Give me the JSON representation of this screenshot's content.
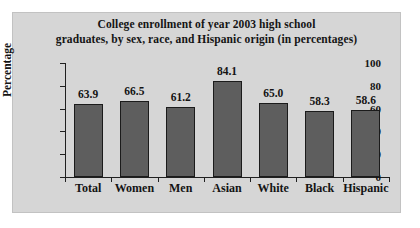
{
  "chart_data": {
    "type": "bar",
    "title": "College enrollment of year 2003 high school graduates, by sex, race, and Hispanic origin (in percentages)",
    "title_lines": [
      "College enrollment of year 2003 high school",
      "graduates, by sex, race, and Hispanic origin (in percentages)"
    ],
    "categories": [
      "Total",
      "Women",
      "Men",
      "Asian",
      "White",
      "Black",
      "Hispanic"
    ],
    "values": [
      63.9,
      66.5,
      61.2,
      84.1,
      65.0,
      58.3,
      58.6
    ],
    "value_labels": [
      "63.9",
      "66.5",
      "61.2",
      "84.1",
      "65.0",
      "58.3",
      "58.6"
    ],
    "xlabel": "",
    "ylabel": "Percentage",
    "ylim": [
      0,
      100
    ],
    "yticks": [
      0,
      20,
      40,
      60,
      80,
      100
    ],
    "ytick_labels": [
      "0",
      "20",
      "40",
      "60",
      "80",
      "100"
    ],
    "grid": false,
    "legend": null,
    "bar_color": "#5e5e5e",
    "bar_edge_color": "#1b1b1b",
    "panel_color": "#d6d6d6",
    "text_color": "#141414"
  }
}
